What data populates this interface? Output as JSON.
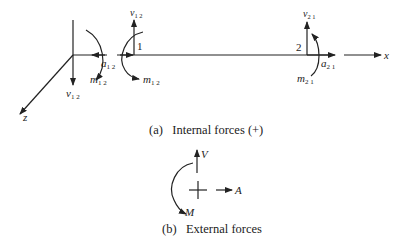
{
  "figure": {
    "part_a": {
      "caption": "(a)   Internal forces (+)",
      "node_labels": {
        "node1": "1",
        "node2": "2"
      },
      "axes": {
        "x": "x",
        "z": "z"
      },
      "forces": {
        "v12_left": {
          "main": "v",
          "sub": "1 2"
        },
        "m12_left": {
          "main": "m",
          "sub": "1 2"
        },
        "a12": {
          "main": "a",
          "sub": "1 2"
        },
        "v12_node1": {
          "main": "v",
          "sub": "1 2"
        },
        "m12_node1": {
          "main": "m",
          "sub": "1 2"
        },
        "v21": {
          "main": "v",
          "sub": "2 1"
        },
        "a21": {
          "main": "a",
          "sub": "2 1"
        },
        "m21": {
          "main": "m",
          "sub": "2 1"
        }
      }
    },
    "part_b": {
      "caption": "(b)   External forces",
      "forces": {
        "V": "V",
        "A": "A",
        "M": "M"
      }
    }
  }
}
